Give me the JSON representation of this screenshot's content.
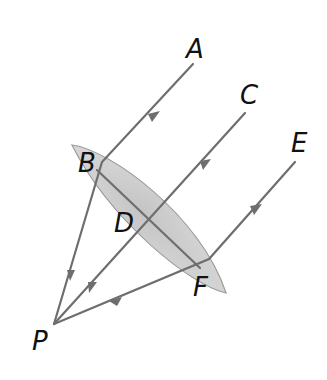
{
  "diagram": {
    "type": "optics-convex-lens-ray-diagram",
    "labels": {
      "A": "A",
      "B": "B",
      "C": "C",
      "D": "D",
      "E": "E",
      "F": "F",
      "P": "P"
    },
    "colors": {
      "ray": "#6e6e6e",
      "lens_fill_light": "#f4f4f4",
      "lens_fill_dark": "#c8c8c8",
      "lens_outline": "#888888",
      "label": "#111111",
      "background": "#ffffff"
    },
    "rays": [
      {
        "from": "A",
        "via": "B",
        "to": "P"
      },
      {
        "from": "C",
        "via": "D",
        "to": "P"
      },
      {
        "from": "E",
        "via": "F",
        "to": "P"
      }
    ],
    "lens_axis": {
      "from": "B",
      "to": "F",
      "through": "D"
    }
  }
}
